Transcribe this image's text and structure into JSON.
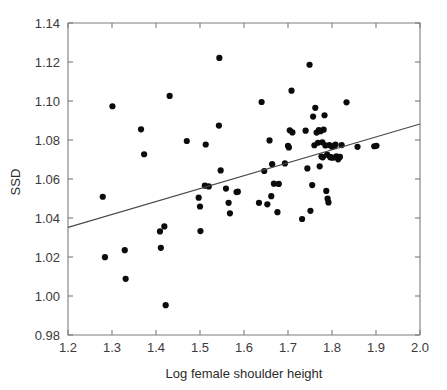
{
  "chart_data": {
    "type": "scatter",
    "title": "",
    "subtitle": "",
    "xlabel": "Log female shoulder height",
    "ylabel": "SSD",
    "xlim": [
      1.2,
      2.0
    ],
    "ylim": [
      0.98,
      1.14
    ],
    "xticks": [
      "1.2",
      "1.3",
      "1.4",
      "1.5",
      "1.6",
      "1.7",
      "1.8",
      "1.9",
      "2.0"
    ],
    "xtick_values": [
      1.2,
      1.3,
      1.4,
      1.5,
      1.6,
      1.7,
      1.8,
      1.9,
      2.0
    ],
    "yticks": [
      "0.98",
      "1.00",
      "1.02",
      "1.04",
      "1.06",
      "1.08",
      "1.10",
      "1.12",
      "1.14"
    ],
    "ytick_values": [
      0.98,
      1.0,
      1.02,
      1.04,
      1.06,
      1.08,
      1.1,
      1.12,
      1.14
    ],
    "grid": false,
    "legend": null,
    "marker": "filled-circle",
    "marker_color": "#0b0b0b",
    "marker_size": 3.1,
    "line_color": "#4a4a4a",
    "axis_color": "#7d7d7d",
    "trend_line": {
      "type": "linear-regression",
      "x": [
        1.2,
        2.0
      ],
      "y": [
        1.0352,
        1.0882
      ],
      "slope": 0.0663,
      "intercept": 0.9556
    },
    "x": [
      1.279,
      1.284,
      1.301,
      1.329,
      1.331,
      1.366,
      1.373,
      1.409,
      1.411,
      1.419,
      1.422,
      1.431,
      1.47,
      1.497,
      1.5,
      1.501,
      1.511,
      1.513,
      1.52,
      1.543,
      1.544,
      1.547,
      1.559,
      1.565,
      1.568,
      1.583,
      1.586,
      1.634,
      1.64,
      1.646,
      1.653,
      1.658,
      1.662,
      1.664,
      1.668,
      1.676,
      1.679,
      1.693,
      1.7,
      1.702,
      1.704,
      1.708,
      1.71,
      1.732,
      1.74,
      1.744,
      1.749,
      1.751,
      1.755,
      1.757,
      1.76,
      1.762,
      1.765,
      1.768,
      1.77,
      1.772,
      1.774,
      1.776,
      1.778,
      1.779,
      1.781,
      1.783,
      1.785,
      1.787,
      1.789,
      1.79,
      1.792,
      1.794,
      1.796,
      1.798,
      1.8,
      1.802,
      1.805,
      1.808,
      1.81,
      1.814,
      1.818,
      1.822,
      1.833,
      1.858,
      1.896,
      1.901
    ],
    "y": [
      1.0509,
      1.0199,
      1.0973,
      1.0235,
      1.0088,
      1.0855,
      1.0727,
      1.0331,
      1.0247,
      1.0357,
      0.9953,
      1.1026,
      1.0795,
      1.0504,
      1.0459,
      1.0333,
      1.0566,
      1.0777,
      1.0562,
      1.0874,
      1.1221,
      1.0644,
      1.0551,
      1.0478,
      1.0424,
      1.0533,
      1.0535,
      1.0478,
      1.0995,
      1.0641,
      1.047,
      1.0798,
      1.0512,
      1.0676,
      1.0576,
      1.043,
      1.0575,
      1.068,
      1.077,
      1.0762,
      1.085,
      1.1053,
      1.0839,
      1.0395,
      1.0848,
      1.0654,
      1.1186,
      1.0437,
      1.0569,
      1.092,
      1.0773,
      1.0965,
      1.0838,
      1.0786,
      1.0851,
      1.0665,
      1.0845,
      1.0715,
      1.0788,
      1.0711,
      1.0853,
      1.0927,
      1.0772,
      1.0539,
      1.0725,
      1.0499,
      1.048,
      1.0774,
      1.0712,
      1.0711,
      1.0766,
      1.0709,
      1.077,
      1.0776,
      1.0716,
      1.0701,
      1.0713,
      1.0774,
      1.0993,
      1.0765,
      1.0768,
      1.077
    ]
  },
  "axes": {
    "x_title": "Log female shoulder height",
    "y_title": "SSD"
  }
}
